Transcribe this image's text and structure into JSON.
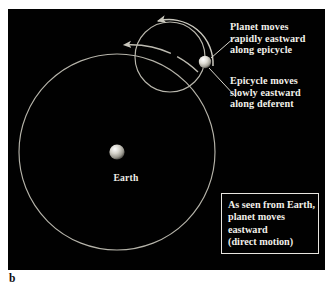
{
  "figure": {
    "caption": "b",
    "background": "#ffffff",
    "panel_background": "#010101"
  },
  "diagram": {
    "type": "astronomical-epicycle-model",
    "orbit_color": "#b9b7ad",
    "text_color": "#f2f0ea",
    "earth": {
      "label": "Earth",
      "center_x": 109,
      "center_y": 143,
      "radius": 7.6,
      "body_color": "#d9d7cf"
    },
    "planet": {
      "center_x": 197,
      "center_y": 53,
      "radius": 6.2,
      "body_color": "#e2e0d8"
    },
    "deferent": {
      "name": "deferent",
      "center_x": 109,
      "center_y": 143,
      "radius": 98
    },
    "epicycle": {
      "name": "epicycle",
      "center_x": 162,
      "center_y": 48,
      "radius": 35
    },
    "arrows": {
      "epicycle_arrow_direction": "eastward-counterclockwise",
      "deferent_arrow_direction": "eastward-counterclockwise"
    }
  },
  "labels": {
    "planet_motion": {
      "line1": "Planet moves",
      "line2": "rapidly eastward",
      "line3": "along epicycle"
    },
    "epicycle_motion": {
      "line1": "Epicycle moves",
      "line2": "slowly eastward",
      "line3": "along deferent"
    }
  },
  "callout": {
    "line1": "As seen from Earth,",
    "line2": "planet moves",
    "line3": "eastward",
    "line4": "(direct motion)",
    "border_color": "#e8e6e0"
  }
}
